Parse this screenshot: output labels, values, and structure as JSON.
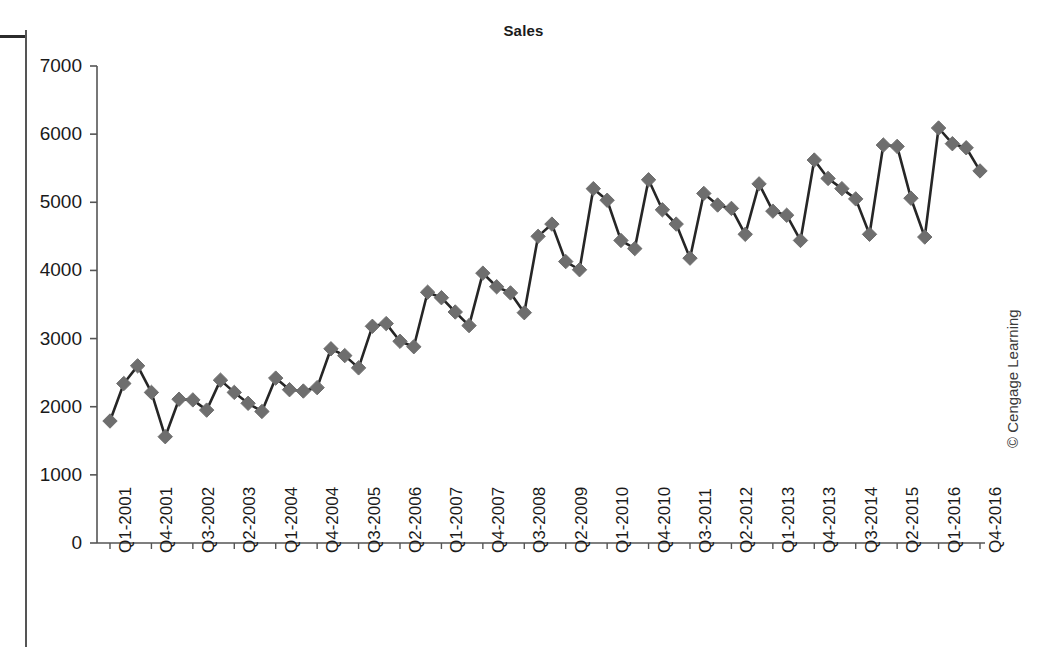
{
  "figure": {
    "title": "Sales",
    "credit": "© Cengage Learning"
  },
  "chart_data": {
    "type": "line",
    "title": "Sales",
    "xlabel": "",
    "ylabel": "",
    "ylim": [
      0,
      7000
    ],
    "ytick_step": 1000,
    "yticks": [
      "0",
      "1000",
      "2000",
      "3000",
      "4000",
      "5000",
      "6000",
      "7000"
    ],
    "grid": false,
    "legend": false,
    "marker": "diamond",
    "series_color": "#6e6e6e",
    "line_color": "#262626",
    "xtick_every": 3,
    "xtick_labels": [
      "Q1-2001",
      "Q4-2001",
      "Q3-2002",
      "Q2-2003",
      "Q1-2004",
      "Q4-2004",
      "Q3-2005",
      "Q2-2006",
      "Q1-2007",
      "Q4-2007",
      "Q3-2008",
      "Q2-2009",
      "Q1-2010",
      "Q4-2010",
      "Q3-2011",
      "Q2-2012",
      "Q1-2013",
      "Q4-2013",
      "Q3-2014",
      "Q2-2015",
      "Q1-2016",
      "Q4-2016"
    ],
    "categories": [
      "Q1-2001",
      "Q2-2001",
      "Q3-2001",
      "Q4-2001",
      "Q1-2002",
      "Q2-2002",
      "Q3-2002",
      "Q4-2002",
      "Q1-2003",
      "Q2-2003",
      "Q3-2003",
      "Q4-2003",
      "Q1-2004",
      "Q2-2004",
      "Q3-2004",
      "Q4-2004",
      "Q1-2005",
      "Q2-2005",
      "Q3-2005",
      "Q4-2005",
      "Q1-2006",
      "Q2-2006",
      "Q3-2006",
      "Q4-2006",
      "Q1-2007",
      "Q2-2007",
      "Q3-2007",
      "Q4-2007",
      "Q1-2008",
      "Q2-2008",
      "Q3-2008",
      "Q4-2008",
      "Q1-2009",
      "Q2-2009",
      "Q3-2009",
      "Q4-2009",
      "Q1-2010",
      "Q2-2010",
      "Q3-2010",
      "Q4-2010",
      "Q1-2011",
      "Q2-2011",
      "Q3-2011",
      "Q4-2011",
      "Q1-2012",
      "Q2-2012",
      "Q3-2012",
      "Q4-2012",
      "Q1-2013",
      "Q2-2013",
      "Q3-2013",
      "Q4-2013",
      "Q1-2014",
      "Q2-2014",
      "Q3-2014",
      "Q4-2014",
      "Q1-2015",
      "Q2-2015",
      "Q3-2015",
      "Q4-2015",
      "Q1-2016",
      "Q2-2016",
      "Q3-2016",
      "Q4-2016"
    ],
    "values": [
      1790,
      2340,
      2600,
      2210,
      1560,
      2110,
      2100,
      1950,
      2390,
      2210,
      2050,
      1930,
      2420,
      2250,
      2230,
      2280,
      2850,
      2750,
      2570,
      3180,
      3220,
      2960,
      2880,
      3680,
      3600,
      3390,
      3190,
      3960,
      3760,
      3670,
      3380,
      4500,
      4680,
      4130,
      4010,
      5200,
      5030,
      4440,
      4320,
      5330,
      4890,
      4680,
      4180,
      5130,
      4960,
      4910,
      4530,
      5270,
      4870,
      4810,
      4440,
      5620,
      5350,
      5200,
      5050,
      4530,
      5840,
      5820,
      5060,
      4490,
      6090,
      5860,
      5800,
      5460
    ],
    "series": [
      {
        "name": "Sales",
        "values": [
          1790,
          2340,
          2600,
          2210,
          1560,
          2110,
          2100,
          1950,
          2390,
          2210,
          2050,
          1930,
          2420,
          2250,
          2230,
          2280,
          2850,
          2750,
          2570,
          3180,
          3220,
          2960,
          2880,
          3680,
          3600,
          3390,
          3190,
          3960,
          3760,
          3670,
          3380,
          4500,
          4680,
          4130,
          4010,
          5200,
          5030,
          4440,
          4320,
          5330,
          4890,
          4680,
          4180,
          5130,
          4960,
          4910,
          4530,
          5270,
          4870,
          4810,
          4440,
          5620,
          5350,
          5200,
          5050,
          4530,
          5840,
          5820,
          5060,
          4490,
          6090,
          5860,
          5800,
          5460
        ]
      }
    ]
  }
}
